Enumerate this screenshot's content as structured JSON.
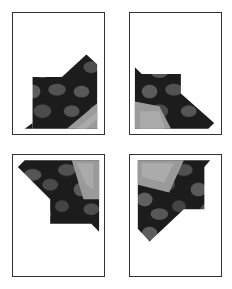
{
  "figure": {
    "panels": [
      {
        "id": "top-left",
        "position": "top-left",
        "content": "cropped photograph of coffee beans and leaf, staircase-shaped crop at lower right"
      },
      {
        "id": "top-right",
        "position": "top-right",
        "content": "cropped photograph of coffee beans and leaf, shape mirrored, at lower left"
      },
      {
        "id": "bottom-left",
        "position": "bottom-left",
        "content": "cropped photograph, shape at upper portion, leaf at top right"
      },
      {
        "id": "bottom-right",
        "position": "bottom-right",
        "content": "cropped photograph, shape at upper left, leaf at top left"
      }
    ],
    "colors": {
      "frame_border": "#333333",
      "background": "#ffffff",
      "dark": "#1a1a1a",
      "bean": "#555555",
      "leaf": "#9a9a9a"
    }
  }
}
